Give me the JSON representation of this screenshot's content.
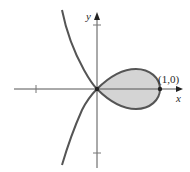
{
  "figure": {
    "type": "curve-plot",
    "equation_hint": "loop curve crossing itself at origin",
    "axes": {
      "x_label": "x",
      "y_label": "y"
    },
    "annotations": {
      "point_label": "(1,0)"
    },
    "colors": {
      "curve": "#555555",
      "fill": "#d4d4d4",
      "axis": "#555555",
      "text": "#2a2a2a"
    }
  }
}
